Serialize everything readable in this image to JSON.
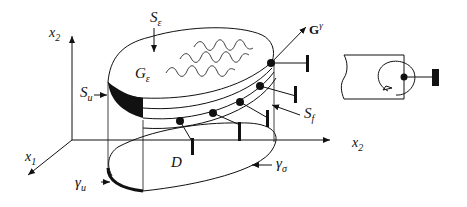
{
  "figure": {
    "labels": {
      "x2_vertical": "x",
      "x2_vertical_sub": "2",
      "x1": "x",
      "x1_sub": "1",
      "x2_horizontal": "x",
      "x2_horizontal_sub": "2",
      "S_eps": "S",
      "S_eps_sub": "ε",
      "G_eps": "G",
      "G_eps_sub": "ε",
      "S_u": "S",
      "S_u_sub": "u",
      "S_f": "S",
      "S_f_sub": "f",
      "D": "D",
      "gamma_u": "γ",
      "gamma_u_sub": "u",
      "gamma_sigma": "γ",
      "gamma_sigma_sub": "σ",
      "G_gamma": "G",
      "G_gamma_sup": "γ"
    },
    "colors": {
      "stroke": "#111111",
      "background": "#ffffff"
    }
  }
}
